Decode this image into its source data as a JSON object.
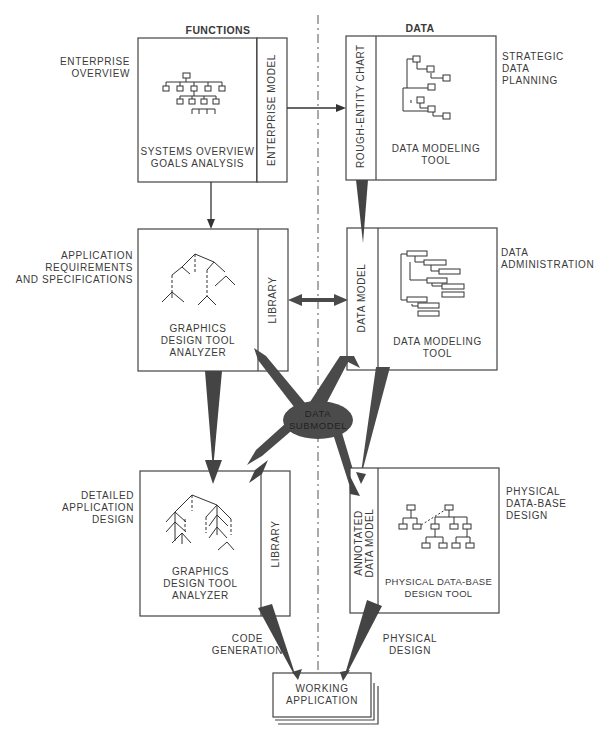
{
  "columns": {
    "functions": "FUNCTIONS",
    "data": "DATA"
  },
  "stages": {
    "enterprise_overview": "ENTERPRISE OVERVIEW",
    "strategic_data_planning": [
      "STRATEGIC",
      "DATA",
      "PLANNING"
    ],
    "app_requirements": [
      "APPLICATION",
      "REQUIREMENTS",
      "AND SPECIFICATIONS"
    ],
    "data_administration": [
      "DATA",
      "ADMINISTRATION"
    ],
    "detailed_app_design": [
      "DETAILED",
      "APPLICATION",
      "DESIGN"
    ],
    "physical_db_design": [
      "PHYSICAL",
      "DATA-BASE",
      "DESIGN"
    ],
    "code_generation": [
      "CODE",
      "GENERATION"
    ],
    "physical_design": [
      "PHYSICAL",
      "DESIGN"
    ]
  },
  "boxes": {
    "systems_overview": {
      "title": [
        "SYSTEMS OVERVIEW",
        "GOALS ANALYSIS"
      ],
      "tab": "ENTERPRISE MODEL"
    },
    "data_modeling_1": {
      "title": [
        "DATA MODELING",
        "TOOL"
      ],
      "tab": "ROUGH-ENTITY CHART"
    },
    "graphics_1": {
      "title": [
        "GRAPHICS",
        "DESIGN TOOL",
        "ANALYZER"
      ],
      "tab": "LIBRARY"
    },
    "data_modeling_2": {
      "title": [
        "DATA MODELING",
        "TOOL"
      ],
      "tab": "DATA MODEL"
    },
    "graphics_2": {
      "title": [
        "GRAPHICS",
        "DESIGN TOOL",
        "ANALYZER"
      ],
      "tab": "LIBRARY"
    },
    "physical_db_tool": {
      "title": [
        "PHYSICAL DATA-BASE",
        "DESIGN TOOL"
      ],
      "tab": [
        "ANNOTATED",
        "DATA MODEL"
      ]
    },
    "working_application": {
      "title": [
        "WORKING",
        "APPLICATION"
      ]
    }
  },
  "hub": {
    "label": [
      "DATA",
      "SUBMODEL"
    ]
  },
  "colors": {
    "line": "#3c3c3c",
    "arrow_fill": "#444444",
    "text": "#3a3a3a",
    "background": "#ffffff"
  }
}
